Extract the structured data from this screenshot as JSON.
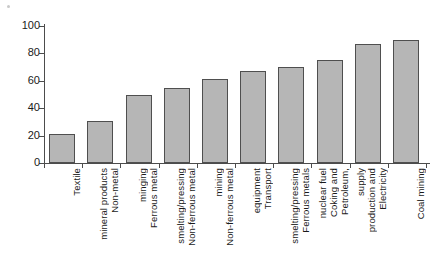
{
  "chart_data": {
    "type": "bar",
    "title": "",
    "xlabel": "",
    "ylabel": "",
    "ylim": [
      0,
      100
    ],
    "yticks": [
      0,
      20,
      40,
      60,
      80,
      100
    ],
    "grid": false,
    "legend": "none",
    "bar_color": "#b6b6b6",
    "bar_border_color": "#4f4f4f",
    "axis_color": "#4c4c4c",
    "categories": [
      "Textile",
      "Non-metal mineral products",
      "Ferrous metal minging",
      "Non-ferrous metal smelting/pressing",
      "Non-ferrous metal mining",
      "Transport equipment",
      "Ferrous metals smelting/pressing",
      "Petroleum, Coking and nuclear fuel",
      "Electricity production and supply",
      "Coal mining"
    ],
    "category_lines": [
      [
        "Textile"
      ],
      [
        "Non-metal",
        "mineral products"
      ],
      [
        "Ferrous metal",
        "minging"
      ],
      [
        "Non-ferrous metal",
        "smelting/pressing"
      ],
      [
        "Non-ferrous metal",
        "mining"
      ],
      [
        "Transport",
        "equipment"
      ],
      [
        "Ferrous metals",
        "smelting/pressing"
      ],
      [
        "Petroleum,",
        "Coking and",
        "nuclear fuel"
      ],
      [
        "Electricity",
        "production and",
        "supply"
      ],
      [
        "Coal mining"
      ]
    ],
    "values": [
      21,
      31,
      50,
      55,
      61,
      67,
      70,
      75,
      87,
      90
    ]
  }
}
